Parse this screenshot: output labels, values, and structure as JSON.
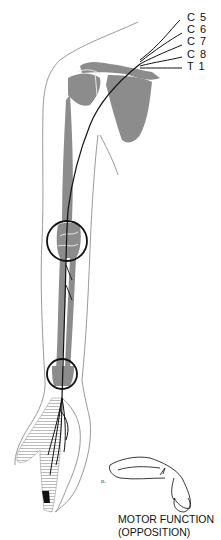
{
  "figure": {
    "colors": {
      "bone": "#8c8c8c",
      "outline": "#9a9a9a",
      "nerve": "#111111",
      "hatch": "#b0b0b0"
    }
  },
  "root_labels": [
    "C 5",
    "C 6",
    "C 7",
    "C 8",
    "T 1"
  ],
  "highlight_circles": [
    {
      "name": "elbow",
      "cx": 67,
      "cy": 241,
      "r": 20
    },
    {
      "name": "wrist",
      "cx": 62,
      "cy": 374,
      "r": 15
    }
  ],
  "inset": {
    "caption_line1": "MOTOR FUNCTION",
    "caption_line2": "(OPPOSITION)"
  }
}
